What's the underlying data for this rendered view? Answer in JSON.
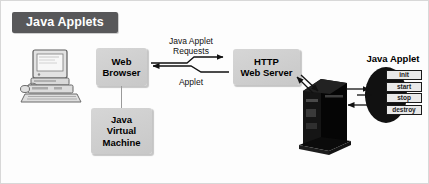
{
  "figure": {
    "title": "Java Applets",
    "background_color": "#fdfdfd",
    "banner_color": "#58585a",
    "banner_text_color": "#ffffff",
    "box_fill_color": "#cfcfcf",
    "applet_oval_color": "#111111"
  },
  "nodes": {
    "client_computer": {
      "icon": "desktop-computer-icon"
    },
    "web_browser": {
      "line1": "Web",
      "line2": "Browser"
    },
    "java_virtual_machine": {
      "line1": "Java",
      "line2": "Virtual",
      "line3": "Machine"
    },
    "http_web_server": {
      "line1": "HTTP",
      "line2": "Web Server"
    },
    "server_tower": {
      "icon": "server-tower-icon"
    },
    "java_applet": {
      "title": "Java Applet",
      "methods": [
        "init",
        "start",
        "stop",
        "destroy"
      ]
    }
  },
  "connections": {
    "request_arrow": {
      "label_line1": "Java Applet",
      "label_line2": "Requests",
      "direction": "browser-to-server"
    },
    "applet_arrow": {
      "label": "Applet",
      "direction": "server-to-browser"
    }
  }
}
